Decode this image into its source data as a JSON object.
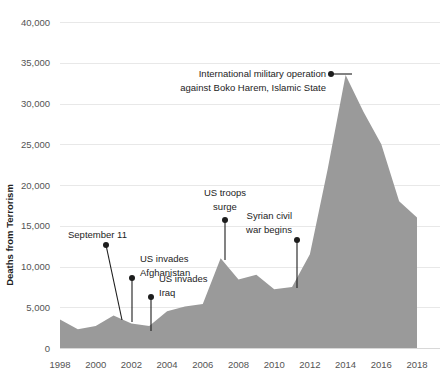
{
  "chart_data": {
    "type": "area",
    "title": "",
    "xlabel": "",
    "ylabel": "Deaths from Terrorism",
    "xlim": [
      1998,
      2018
    ],
    "ylim": [
      0,
      40000
    ],
    "grid": true,
    "legend": "none",
    "fill_color": "#9a9a9a",
    "grid_color": "#e8e8e8",
    "x": [
      1998,
      1999,
      2000,
      2001,
      2002,
      2003,
      2004,
      2005,
      2006,
      2007,
      2008,
      2009,
      2010,
      2011,
      2012,
      2013,
      2014,
      2015,
      2016,
      2017,
      2018
    ],
    "values": [
      3500,
      2300,
      2700,
      4000,
      3000,
      2700,
      4500,
      5100,
      5400,
      11000,
      8400,
      9000,
      7200,
      7500,
      11500,
      22000,
      33500,
      29000,
      25000,
      18000,
      16000
    ],
    "xticks": [
      1998,
      2000,
      2002,
      2004,
      2006,
      2008,
      2010,
      2012,
      2014,
      2016,
      2018
    ],
    "xtick_labels": [
      "1998",
      "2000",
      "2002",
      "2004",
      "2006",
      "2008",
      "2010",
      "2012",
      "2014",
      "2016",
      "2018"
    ],
    "yticks": [
      0,
      5000,
      10000,
      15000,
      20000,
      25000,
      30000,
      35000,
      40000
    ],
    "ytick_labels": [
      "0",
      "5,000",
      "10,000",
      "15,000",
      "20,000",
      "25,000",
      "30,000",
      "35,000",
      "40,000"
    ],
    "annotations": [
      {
        "id": "september-11",
        "lines": [
          "September 11"
        ],
        "text": "September 11",
        "dot_x": 106,
        "dot_y": 245,
        "line_end_x": 122,
        "line_end_y": 320,
        "text_x": 68,
        "text_y": 238,
        "anchor": "start"
      },
      {
        "id": "us-invades-afghanistan",
        "lines": [
          "US invades",
          "Afghanistan"
        ],
        "text": "US invades Afghanistan",
        "dot_x": 132,
        "dot_y": 278,
        "line_end_x": 132,
        "line_end_y": 322,
        "text_x": 140,
        "text_y": 262,
        "anchor": "start"
      },
      {
        "id": "us-invades-iraq",
        "lines": [
          "US invades",
          "Iraq"
        ],
        "text": "US invades Iraq",
        "dot_x": 151,
        "dot_y": 297,
        "line_end_x": 151,
        "line_end_y": 331,
        "text_x": 159,
        "text_y": 282,
        "anchor": "start"
      },
      {
        "id": "us-troops-surge",
        "lines": [
          "US troops",
          "surge"
        ],
        "text": "US troops surge",
        "dot_x": 225,
        "dot_y": 220,
        "line_end_x": 225,
        "line_end_y": 260,
        "text_x": 225,
        "text_y": 196,
        "anchor": "middle"
      },
      {
        "id": "syrian-civil-war-begins",
        "lines": [
          "Syrian civil",
          "war begins"
        ],
        "text": "Syrian civil war begins",
        "dot_x": 297,
        "dot_y": 240,
        "line_end_x": 297,
        "line_end_y": 288,
        "text_x": 292,
        "text_y": 219,
        "anchor": "end"
      },
      {
        "id": "international-military-operation",
        "lines": [
          "International military operation",
          "against Boko Harem, Islamic State"
        ],
        "text": "International military operation against Boko Harem, Islamic State",
        "dot_x": 331,
        "dot_y": 74,
        "line_end_x": 352,
        "line_end_y": 74,
        "text_x": 326,
        "text_y": 77,
        "anchor": "end"
      }
    ]
  }
}
